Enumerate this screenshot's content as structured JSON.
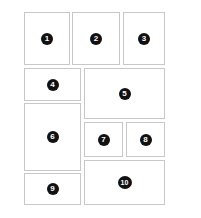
{
  "diagram": {
    "type": "panel-layout",
    "panels": [
      {
        "id": 1,
        "label": "1",
        "x": 24,
        "y": 12,
        "w": 46,
        "h": 53
      },
      {
        "id": 2,
        "label": "2",
        "x": 72,
        "y": 12,
        "w": 48,
        "h": 53
      },
      {
        "id": 3,
        "label": "3",
        "x": 123,
        "y": 12,
        "w": 42,
        "h": 53
      },
      {
        "id": 4,
        "label": "4",
        "x": 24,
        "y": 68,
        "w": 57,
        "h": 33
      },
      {
        "id": 5,
        "label": "5",
        "x": 84,
        "y": 68,
        "w": 81,
        "h": 51
      },
      {
        "id": 6,
        "label": "6",
        "x": 24,
        "y": 103,
        "w": 57,
        "h": 68
      },
      {
        "id": 7,
        "label": "7",
        "x": 84,
        "y": 122,
        "w": 39,
        "h": 35
      },
      {
        "id": 8,
        "label": "8",
        "x": 126,
        "y": 122,
        "w": 39,
        "h": 35
      },
      {
        "id": 9,
        "label": "9",
        "x": 24,
        "y": 173,
        "w": 57,
        "h": 32
      },
      {
        "id": 10,
        "label": "10",
        "x": 84,
        "y": 160,
        "w": 81,
        "h": 45
      }
    ],
    "colors": {
      "border": "#c8c8c8",
      "badge": "#111111",
      "badge_text": "#ffffff"
    }
  }
}
